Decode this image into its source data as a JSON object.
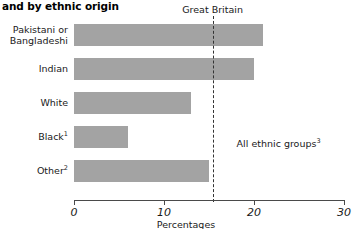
{
  "chart_data": {
    "type": "bar",
    "orientation": "horizontal",
    "title": "and by ethnic origin",
    "xlabel": "Percentages",
    "ylabel": "",
    "xlim": [
      0,
      30
    ],
    "xticks": [
      0,
      10,
      20,
      30
    ],
    "xtick_labels": [
      "0",
      "10",
      "20",
      "30"
    ],
    "grid": false,
    "legend": "none",
    "categories": [
      "Pakistani or Bangladeshi",
      "Indian",
      "White",
      "Black¹",
      "Other²"
    ],
    "category_lines": [
      [
        "Pakistani or",
        "Bangladeshi"
      ],
      [
        "Indian"
      ],
      [
        "White"
      ],
      [
        "Black¹"
      ],
      [
        "Other²"
      ]
    ],
    "values": [
      21,
      20,
      13,
      6,
      15
    ],
    "bar_color": "#a3a3a3",
    "annotations": [
      {
        "name": "great-britain-label",
        "text": "Great Britain",
        "value": 15.4
      },
      {
        "name": "all-ethnic-groups-note",
        "text": "All ethnic groups³",
        "value": 15.4
      }
    ],
    "reference_line": {
      "label": "Great Britain",
      "value": 15.4,
      "style": "dashed"
    }
  },
  "labels": {
    "title": "and by ethnic origin",
    "great_britain": "Great Britain",
    "all_ethnic_groups": "All ethnic groups",
    "all_ethnic_groups_sup": "3",
    "x_axis_title": "Percentages",
    "cat_0_line_1": "Pakistani or",
    "cat_0_line_2": "Bangladeshi",
    "cat_1": "Indian",
    "cat_2": "White",
    "cat_3": "Black",
    "cat_3_sup": "1",
    "cat_4": "Other",
    "cat_4_sup": "2",
    "tick_0": "0",
    "tick_1": "10",
    "tick_2": "20",
    "tick_3": "30"
  }
}
